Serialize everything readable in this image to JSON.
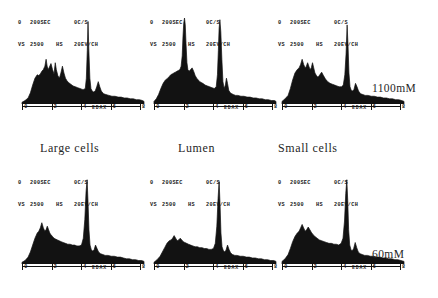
{
  "figure": {
    "ink_color": "#121212",
    "background": "#ffffff"
  },
  "column_captions": [
    {
      "id": "large-cells",
      "label": "Large cells"
    },
    {
      "id": "lumen",
      "label": "Lumen"
    },
    {
      "id": "small-cells",
      "label": "Small cells"
    }
  ],
  "row_labels": [
    {
      "id": "row-1100mM",
      "label": "1100mM"
    },
    {
      "id": "row-60mM",
      "label": "60mM"
    }
  ],
  "axis": {
    "tick_labels": [
      "0",
      "2",
      "4",
      "6",
      "8"
    ],
    "tick_values": [
      0,
      2,
      4,
      6,
      8
    ],
    "corner_label": "EDAX",
    "units": "keV"
  },
  "instrument_header": {
    "line1": {
      "cursor": "0",
      "time": "200SEC",
      "rate": "0C/S"
    },
    "line2": {
      "vs_label": "VS",
      "vs_value": "2500",
      "hs_label": "HS",
      "hs_value": "20EV/CH"
    }
  },
  "chart_data": [
    {
      "id": "panel-large-cells-1100",
      "type": "line",
      "title": "Large cells 1100mM",
      "xlabel": "EDAX",
      "ylabel": "counts",
      "xlim": [
        0,
        8
      ],
      "ylim": [
        0,
        100
      ],
      "grid": false,
      "legend": "none",
      "filled": true,
      "annotations": [
        "0 200SEC 0C/S",
        "VS 2500 HS 20EV/CH"
      ],
      "x": [
        0.0,
        0.2,
        0.4,
        0.55,
        0.7,
        0.85,
        1.0,
        1.1,
        1.2,
        1.3,
        1.4,
        1.5,
        1.58,
        1.65,
        1.72,
        1.8,
        1.9,
        2.0,
        2.1,
        2.18,
        2.25,
        2.35,
        2.45,
        2.55,
        2.65,
        2.75,
        2.85,
        2.95,
        3.05,
        3.2,
        3.35,
        3.5,
        3.65,
        3.8,
        3.95,
        4.05,
        4.15,
        4.22,
        4.28,
        4.33,
        4.38,
        4.45,
        4.52,
        4.6,
        4.7,
        4.8,
        4.9,
        5.0,
        5.1,
        5.2,
        5.35,
        5.5,
        5.7,
        5.9,
        6.1,
        6.3,
        6.5,
        6.7,
        6.9,
        7.1,
        7.3,
        7.5,
        7.7,
        7.9,
        8.0
      ],
      "y": [
        2,
        4,
        7,
        13,
        22,
        30,
        34,
        33,
        35,
        38,
        40,
        44,
        52,
        44,
        40,
        43,
        47,
        40,
        35,
        48,
        40,
        33,
        30,
        36,
        44,
        36,
        30,
        27,
        25,
        23,
        21,
        20,
        19,
        18,
        17,
        17,
        18,
        30,
        62,
        96,
        64,
        30,
        18,
        15,
        14,
        15,
        20,
        26,
        20,
        15,
        12,
        11,
        10,
        9,
        9,
        8,
        8,
        7,
        7,
        6,
        6,
        5,
        5,
        4,
        3
      ]
    },
    {
      "id": "panel-lumen-1100",
      "type": "line",
      "title": "Lumen 1100mM",
      "xlabel": "EDAX",
      "ylabel": "counts",
      "xlim": [
        0,
        8
      ],
      "ylim": [
        0,
        100
      ],
      "grid": false,
      "legend": "none",
      "filled": true,
      "annotations": [
        "0 200SEC 0C/S",
        "VS 2500 HS 20EV/CH"
      ],
      "x": [
        0.0,
        0.15,
        0.3,
        0.45,
        0.6,
        0.75,
        0.9,
        1.0,
        1.1,
        1.2,
        1.3,
        1.4,
        1.5,
        1.6,
        1.7,
        1.78,
        1.85,
        1.9,
        1.95,
        2.0,
        2.05,
        2.1,
        2.16,
        2.22,
        2.3,
        2.4,
        2.5,
        2.6,
        2.7,
        2.8,
        2.9,
        3.0,
        3.1,
        3.2,
        3.35,
        3.5,
        3.65,
        3.8,
        3.95,
        4.08,
        4.16,
        4.22,
        4.27,
        4.32,
        4.38,
        4.45,
        4.52,
        4.6,
        4.68,
        4.75,
        4.82,
        4.9,
        5.0,
        5.1,
        5.2,
        5.35,
        5.5,
        5.7,
        5.9,
        6.1,
        6.3,
        6.5,
        6.7,
        6.9,
        7.1,
        7.3,
        7.5,
        7.7,
        7.9,
        8.0
      ],
      "y": [
        3,
        6,
        11,
        18,
        24,
        28,
        30,
        32,
        34,
        35,
        36,
        37,
        38,
        39,
        40,
        44,
        56,
        78,
        94,
        100,
        92,
        70,
        48,
        40,
        38,
        40,
        42,
        38,
        33,
        30,
        28,
        26,
        25,
        24,
        22,
        21,
        20,
        19,
        18,
        20,
        34,
        62,
        88,
        98,
        84,
        52,
        26,
        18,
        22,
        30,
        24,
        16,
        13,
        12,
        11,
        10,
        10,
        9,
        9,
        8,
        8,
        7,
        7,
        6,
        6,
        5,
        5,
        4,
        4,
        3
      ]
    },
    {
      "id": "panel-small-cells-1100",
      "type": "line",
      "title": "Small cells 1100mM",
      "xlabel": "EDAX",
      "ylabel": "counts",
      "xlim": [
        0,
        8
      ],
      "ylim": [
        0,
        100
      ],
      "grid": false,
      "legend": "none",
      "filled": true,
      "annotations": [
        "0 200SEC 0C/S",
        "VS 2500 HS 20EV/CH"
      ],
      "x": [
        0.0,
        0.2,
        0.4,
        0.55,
        0.7,
        0.85,
        1.0,
        1.12,
        1.22,
        1.32,
        1.42,
        1.52,
        1.6,
        1.68,
        1.76,
        1.84,
        1.92,
        2.0,
        2.08,
        2.16,
        2.26,
        2.36,
        2.48,
        2.6,
        2.72,
        2.85,
        3.0,
        3.15,
        3.3,
        3.45,
        3.6,
        3.75,
        3.9,
        4.02,
        4.12,
        4.2,
        4.27,
        4.33,
        4.39,
        4.46,
        4.54,
        4.62,
        4.72,
        4.82,
        4.92,
        5.02,
        5.15,
        5.3,
        5.45,
        5.65,
        5.85,
        6.05,
        6.25,
        6.45,
        6.65,
        6.85,
        7.05,
        7.25,
        7.45,
        7.65,
        7.85,
        8.0
      ],
      "y": [
        3,
        6,
        10,
        18,
        28,
        36,
        40,
        42,
        46,
        52,
        46,
        42,
        44,
        48,
        44,
        40,
        42,
        48,
        42,
        36,
        33,
        31,
        34,
        37,
        33,
        29,
        26,
        24,
        23,
        22,
        21,
        20,
        20,
        22,
        34,
        58,
        92,
        68,
        36,
        20,
        16,
        15,
        17,
        24,
        20,
        15,
        12,
        11,
        10,
        10,
        9,
        9,
        8,
        8,
        7,
        7,
        6,
        6,
        5,
        5,
        4,
        3
      ]
    },
    {
      "id": "panel-large-cells-60",
      "type": "line",
      "title": "Large cells 60mM",
      "xlabel": "EDAX",
      "ylabel": "counts",
      "xlim": [
        0,
        8
      ],
      "ylim": [
        0,
        100
      ],
      "grid": false,
      "legend": "none",
      "filled": true,
      "annotations": [
        "0 200SEC 0C/S",
        "VS 2500 HS 20EV/CH"
      ],
      "x": [
        0.0,
        0.2,
        0.4,
        0.55,
        0.7,
        0.85,
        1.0,
        1.1,
        1.2,
        1.3,
        1.4,
        1.5,
        1.58,
        1.66,
        1.74,
        1.82,
        1.9,
        2.0,
        2.1,
        2.2,
        2.32,
        2.44,
        2.56,
        2.7,
        2.85,
        3.0,
        3.15,
        3.3,
        3.45,
        3.6,
        3.75,
        3.9,
        4.02,
        4.12,
        4.2,
        4.27,
        4.33,
        4.39,
        4.46,
        4.54,
        4.62,
        4.72,
        4.82,
        4.92,
        5.02,
        5.15,
        5.3,
        5.45,
        5.65,
        5.85,
        6.05,
        6.25,
        6.45,
        6.65,
        6.85,
        7.05,
        7.25,
        7.45,
        7.65,
        7.85,
        8.0
      ],
      "y": [
        2,
        4,
        8,
        14,
        22,
        30,
        36,
        38,
        42,
        48,
        42,
        38,
        40,
        44,
        40,
        36,
        34,
        32,
        30,
        29,
        28,
        27,
        26,
        25,
        24,
        23,
        23,
        22,
        22,
        21,
        21,
        22,
        30,
        52,
        84,
        98,
        72,
        40,
        22,
        17,
        15,
        16,
        22,
        18,
        14,
        12,
        11,
        10,
        10,
        9,
        9,
        8,
        8,
        7,
        6,
        6,
        5,
        5,
        4,
        4,
        3
      ]
    },
    {
      "id": "panel-lumen-60",
      "type": "line",
      "title": "Lumen 60mM",
      "xlabel": "EDAX",
      "ylabel": "counts",
      "xlim": [
        0,
        8
      ],
      "ylim": [
        0,
        100
      ],
      "grid": false,
      "legend": "none",
      "filled": true,
      "annotations": [
        "0 200SEC 0C/S",
        "VS 2500 HS 20EV/CH"
      ],
      "x": [
        0.0,
        0.2,
        0.4,
        0.55,
        0.7,
        0.85,
        1.0,
        1.12,
        1.22,
        1.32,
        1.42,
        1.52,
        1.62,
        1.72,
        1.82,
        1.92,
        2.02,
        2.14,
        2.26,
        2.4,
        2.55,
        2.7,
        2.85,
        3.0,
        3.15,
        3.3,
        3.45,
        3.6,
        3.75,
        3.9,
        4.02,
        4.12,
        4.2,
        4.27,
        4.33,
        4.39,
        4.46,
        4.54,
        4.62,
        4.72,
        4.82,
        4.92,
        5.02,
        5.15,
        5.3,
        5.45,
        5.65,
        5.85,
        6.05,
        6.25,
        6.45,
        6.65,
        6.85,
        7.05,
        7.25,
        7.45,
        7.65,
        7.85,
        8.0
      ],
      "y": [
        2,
        5,
        9,
        14,
        19,
        24,
        27,
        28,
        30,
        33,
        30,
        27,
        28,
        30,
        28,
        26,
        25,
        24,
        23,
        22,
        21,
        20,
        20,
        19,
        19,
        18,
        18,
        17,
        17,
        18,
        24,
        44,
        76,
        96,
        70,
        36,
        20,
        16,
        14,
        16,
        22,
        17,
        13,
        11,
        10,
        10,
        9,
        9,
        8,
        8,
        7,
        7,
        6,
        6,
        5,
        5,
        4,
        4,
        3
      ]
    },
    {
      "id": "panel-small-cells-60",
      "type": "line",
      "title": "Small cells 60mM",
      "xlabel": "EDAX",
      "ylabel": "counts",
      "xlim": [
        0,
        8
      ],
      "ylim": [
        0,
        100
      ],
      "grid": false,
      "legend": "none",
      "filled": true,
      "annotations": [
        "0 200SEC 0C/S",
        "VS 2500 HS 20EV/CH"
      ],
      "x": [
        0.0,
        0.2,
        0.4,
        0.55,
        0.7,
        0.85,
        1.0,
        1.12,
        1.22,
        1.32,
        1.42,
        1.52,
        1.62,
        1.72,
        1.82,
        1.92,
        2.04,
        2.16,
        2.3,
        2.45,
        2.6,
        2.76,
        2.92,
        3.08,
        3.24,
        3.4,
        3.56,
        3.72,
        3.88,
        4.0,
        4.1,
        4.18,
        4.25,
        4.31,
        4.37,
        4.44,
        4.52,
        4.6,
        4.7,
        4.8,
        4.9,
        5.0,
        5.12,
        5.26,
        5.42,
        5.6,
        5.8,
        6.0,
        6.2,
        6.4,
        6.6,
        6.8,
        7.0,
        7.2,
        7.4,
        7.6,
        7.8,
        8.0
      ],
      "y": [
        3,
        6,
        11,
        18,
        26,
        32,
        36,
        38,
        42,
        46,
        42,
        38,
        40,
        43,
        40,
        37,
        34,
        32,
        30,
        28,
        27,
        26,
        25,
        24,
        24,
        23,
        23,
        22,
        24,
        30,
        50,
        82,
        98,
        74,
        40,
        22,
        17,
        15,
        18,
        25,
        19,
        14,
        12,
        11,
        10,
        10,
        9,
        9,
        8,
        8,
        7,
        7,
        6,
        6,
        5,
        5,
        4,
        3
      ]
    }
  ]
}
